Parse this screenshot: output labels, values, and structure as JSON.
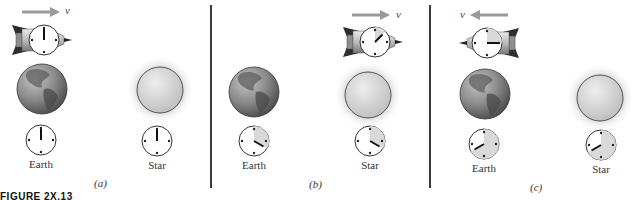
{
  "figure": {
    "caption_fragment": "FIGURE 2X.13",
    "velocity_symbol": "v",
    "colors": {
      "arrow": "#9a9a9a",
      "divider": "#3a3a3a",
      "clock_elapsed_shade": "#d9d9d9",
      "earth": "#7a7a7a",
      "star": "#cfcfcf"
    }
  },
  "panels": [
    {
      "id": "a",
      "label": "(a)",
      "rocket_direction": "right",
      "rocket_clock": {
        "hour": 12,
        "elapsed_fraction": 0
      },
      "earth_label": "Earth",
      "star_label": "Star",
      "earth_clock": {
        "hour": 12,
        "elapsed_fraction": 0
      },
      "star_clock": {
        "hour": 12,
        "elapsed_fraction": 0
      },
      "rocket_position": "near Earth"
    },
    {
      "id": "b",
      "label": "(b)",
      "rocket_direction": "right",
      "rocket_clock": {
        "hour": "~1:30",
        "elapsed_fraction": 0.125
      },
      "earth_label": "Earth",
      "star_label": "Star",
      "earth_clock": {
        "hour": 4,
        "elapsed_fraction": 0.333
      },
      "star_clock": {
        "hour": 4,
        "elapsed_fraction": 0.333
      },
      "rocket_position": "at Star"
    },
    {
      "id": "c",
      "label": "(c)",
      "rocket_direction": "left",
      "rocket_clock": {
        "hour": 3,
        "elapsed_fraction": 0.25
      },
      "earth_label": "Earth",
      "star_label": "Star",
      "earth_clock": {
        "hour": 8,
        "elapsed_fraction": 0.667
      },
      "star_clock": {
        "hour": 8,
        "elapsed_fraction": 0.667
      },
      "rocket_position": "back at Earth"
    }
  ]
}
